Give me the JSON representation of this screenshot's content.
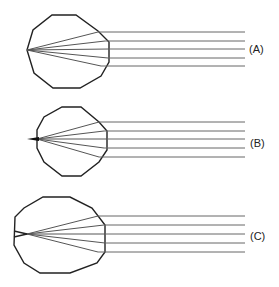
{
  "panels": [
    {
      "id": "A",
      "label": "(A)",
      "label_pos": [
        249,
        51
      ],
      "polygon": [
        [
          52,
          15
        ],
        [
          76,
          15
        ],
        [
          98,
          31
        ],
        [
          109,
          42
        ],
        [
          109,
          62
        ],
        [
          101,
          76
        ],
        [
          80,
          88
        ],
        [
          53,
          88
        ],
        [
          34,
          73
        ],
        [
          27,
          50
        ],
        [
          33,
          30
        ]
      ],
      "focus": [
        27,
        50
      ],
      "ray_hits": [
        [
          98,
          32
        ],
        [
          105,
          41
        ],
        [
          109,
          49
        ],
        [
          108,
          58
        ],
        [
          101,
          66
        ]
      ],
      "line_ys": [
        32,
        41,
        49,
        58,
        66
      ],
      "line_end_x": 245,
      "arrow": false
    },
    {
      "id": "B",
      "label": "(B)",
      "label_pos": [
        250,
        145
      ],
      "polygon": [
        [
          62,
          107
        ],
        [
          81,
          107
        ],
        [
          99,
          122
        ],
        [
          107,
          131
        ],
        [
          107,
          150
        ],
        [
          99,
          162
        ],
        [
          81,
          176
        ],
        [
          62,
          176
        ],
        [
          44,
          162
        ],
        [
          37,
          148
        ],
        [
          37,
          130
        ],
        [
          44,
          117
        ]
      ],
      "focus": [
        37,
        139
      ],
      "ray_hits": [
        [
          99,
          122
        ],
        [
          104,
          131
        ],
        [
          107,
          139
        ],
        [
          104,
          148
        ],
        [
          99,
          157
        ]
      ],
      "line_ys": [
        122,
        131,
        139,
        148,
        157
      ],
      "line_end_x": 245,
      "arrow": true,
      "arrow_tip": [
        27,
        139
      ]
    },
    {
      "id": "C",
      "label": "(C)",
      "label_pos": [
        250,
        238
      ],
      "polygon": [
        [
          43,
          197
        ],
        [
          70,
          197
        ],
        [
          92,
          208
        ],
        [
          105,
          225
        ],
        [
          105,
          252
        ],
        [
          97,
          263
        ],
        [
          70,
          273
        ],
        [
          40,
          273
        ],
        [
          24,
          263
        ],
        [
          14,
          245
        ],
        [
          15,
          217
        ],
        [
          24,
          208
        ]
      ],
      "focus": [
        27,
        234
      ],
      "ray_hits": [
        [
          98,
          216
        ],
        [
          104,
          225
        ],
        [
          105,
          234
        ],
        [
          105,
          243
        ],
        [
          98,
          252
        ]
      ],
      "line_ys": [
        216,
        225,
        234,
        243,
        252
      ],
      "line_end_x": 245,
      "arrow": false,
      "back_rays": [
        [
          14,
          231
        ],
        [
          14,
          237
        ]
      ]
    }
  ],
  "colors": {
    "outline": "#222222",
    "ray": "#555555",
    "line": "#666666"
  }
}
